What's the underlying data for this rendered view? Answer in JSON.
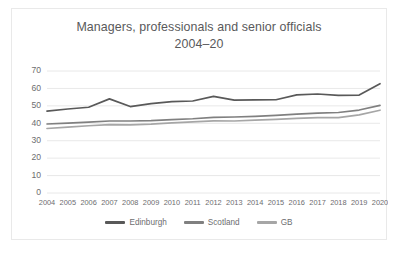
{
  "chart_data": {
    "type": "line",
    "title": "Managers, professionals and senior officials 2004–20",
    "title_line1": "Managers, professionals and senior officials",
    "title_line2": "2004–20",
    "xlabel": "",
    "ylabel": "",
    "x": [
      2004,
      2005,
      2006,
      2007,
      2008,
      2009,
      2010,
      2011,
      2012,
      2013,
      2014,
      2015,
      2016,
      2017,
      2018,
      2019,
      2020
    ],
    "categories": [
      "2004",
      "2005",
      "2006",
      "2007",
      "2008",
      "2009",
      "2010",
      "2011",
      "2012",
      "2013",
      "2014",
      "2015",
      "2016",
      "2017",
      "2018",
      "2019",
      "2020"
    ],
    "ylim": [
      0,
      70
    ],
    "yticks": [
      0,
      10,
      20,
      30,
      40,
      50,
      60,
      70
    ],
    "ytick_labels": [
      "0",
      "10",
      "20",
      "30",
      "40",
      "50",
      "60",
      "70"
    ],
    "grid": true,
    "legend_position": "bottom",
    "series": [
      {
        "name": "Edinburgh",
        "color": "#595959",
        "values": [
          47.0,
          48.2,
          49.2,
          54.0,
          49.6,
          51.3,
          52.4,
          52.8,
          55.4,
          53.3,
          53.4,
          53.5,
          56.3,
          56.8,
          56.0,
          56.2,
          62.7
        ]
      },
      {
        "name": "Scotland",
        "color": "#808080",
        "values": [
          39.6,
          40.1,
          40.7,
          41.3,
          41.3,
          41.5,
          42.1,
          42.6,
          43.4,
          43.6,
          44.0,
          44.5,
          45.2,
          45.8,
          46.2,
          47.6,
          50.3
        ]
      },
      {
        "name": "GB",
        "color": "#a6a6a6",
        "values": [
          37.0,
          37.8,
          38.6,
          39.2,
          39.1,
          39.5,
          40.2,
          40.8,
          41.4,
          41.3,
          41.8,
          42.3,
          42.8,
          43.2,
          43.2,
          44.8,
          47.5
        ]
      }
    ]
  },
  "colors": {
    "background": "#ffffff",
    "border": "#e9e9e9",
    "gridline": "#e2e2e2",
    "text": "#6d6d6f",
    "title_text": "#59595b"
  }
}
